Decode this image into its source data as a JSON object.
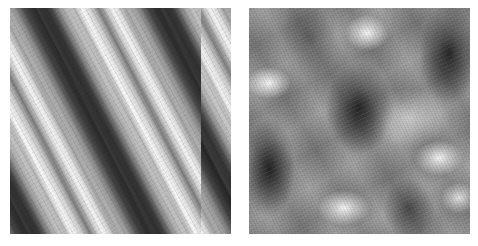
{
  "figure": {
    "panels": [
      {
        "id": "left",
        "description": "Grayscale texture of parallel diagonal stripes running from upper-left to lower-right"
      },
      {
        "id": "right",
        "description": "Grayscale blurred checkerboard-like interference texture with alternating light and dark blobs"
      }
    ],
    "colors": {
      "background": "#ffffff",
      "dark": "#1e1e1e",
      "mid": "#8a8a8a",
      "light": "#f8f8f8"
    }
  }
}
